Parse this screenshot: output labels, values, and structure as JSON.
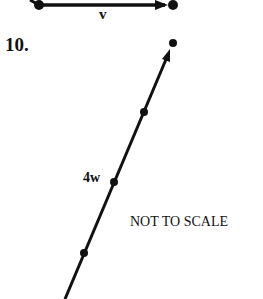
{
  "problem_number": "10.",
  "vector_v": {
    "label": "v",
    "start": [
      39,
      5
    ],
    "end": [
      173,
      5
    ]
  },
  "vector_4w": {
    "label": "4w",
    "start": [
      65,
      299
    ],
    "end": [
      173,
      43
    ],
    "intermediate_points": [
      [
        144,
        112
      ],
      [
        114,
        182
      ],
      [
        84,
        253
      ]
    ]
  },
  "note": "NOT TO SCALE",
  "colors": {
    "ink": "#111111",
    "background": "#ffffff"
  }
}
